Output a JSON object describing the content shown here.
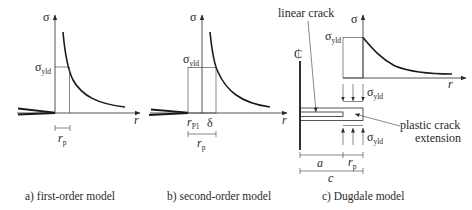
{
  "panels": [
    {
      "id": "a",
      "caption": "a) first-order model",
      "y_axis_label": "σ",
      "x_axis_label": "r",
      "yield_label_main": "σ",
      "yield_label_sub": "yld",
      "plastic_zone_label_main": "r",
      "plastic_zone_label_sub": "p"
    },
    {
      "id": "b",
      "caption": "b) second-order model",
      "y_axis_label": "σ",
      "x_axis_label": "r",
      "yield_label_main": "σ",
      "yield_label_sub": "yld",
      "rp1_label_main": "r",
      "rp1_label_sub": "P1",
      "delta_label": "δ",
      "plastic_zone_label_main": "r",
      "plastic_zone_label_sub": "p"
    },
    {
      "id": "c",
      "caption": "c) Dugdale model",
      "y_axis_label": "σ",
      "x_axis_label": "r",
      "centerline_label": "₵",
      "yield_label_main": "σ",
      "yield_label_sub": "yld",
      "linear_crack_label": "linear crack",
      "plastic_extension_label_line1": "plastic crack",
      "plastic_extension_label_line2": "extension",
      "upper_stress_main": "σ",
      "upper_stress_sub": "yld",
      "lower_stress_main": "σ",
      "lower_stress_sub": "yld",
      "a_label": "a",
      "rp_label_main": "r",
      "rp_label_sub": "p",
      "c_label": "c"
    }
  ]
}
